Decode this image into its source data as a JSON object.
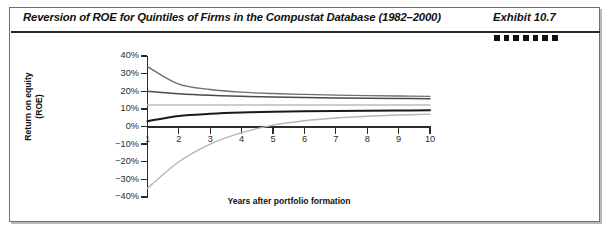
{
  "exhibit": {
    "title": "Reversion of ROE for Quintiles of Firms in the Compustat Database (1982–2000)",
    "label": "Exhibit 10.7",
    "decorative_square_count": 7,
    "decorative_square_color": "#111111",
    "border_color": "#6e6e6e"
  },
  "chart_data": {
    "type": "line",
    "title": "Reversion of ROE for Quintiles of Firms in the Compustat Database (1982–2000)",
    "xlabel": "Years after portfolio formation",
    "ylabel": "Return on equity (ROE)",
    "ylabel_lines": [
      "Return on equity",
      "(ROE)"
    ],
    "x": [
      1,
      2,
      3,
      4,
      5,
      6,
      7,
      8,
      9,
      10
    ],
    "xtick_labels": [
      "1",
      "2",
      "3",
      "4",
      "5",
      "6",
      "7",
      "8",
      "9",
      "10"
    ],
    "xlim": [
      1,
      10
    ],
    "ylim": [
      -40,
      40
    ],
    "ytick_labels": [
      "40%",
      "30%",
      "20%",
      "10%",
      "0%",
      "−10%",
      "−20%",
      "−30%",
      "−40%"
    ],
    "ytick_values": [
      40,
      30,
      20,
      10,
      0,
      -10,
      -20,
      -30,
      -40
    ],
    "grid": false,
    "legend": false,
    "axis_zero_line": true,
    "series": [
      {
        "name": "Quintile 1 (highest ROE)",
        "color": "#6f6f6f",
        "width": 1.4,
        "values": [
          34,
          24,
          21,
          19.5,
          18.7,
          18.2,
          17.8,
          17.5,
          17.3,
          17.1
        ]
      },
      {
        "name": "Quintile 2",
        "color": "#4a4a4a",
        "width": 1.5,
        "values": [
          20,
          18.6,
          17.7,
          17.1,
          16.7,
          16.4,
          16.2,
          16.0,
          15.9,
          15.8
        ]
      },
      {
        "name": "Quintile 3 (median)",
        "color": "#bdbdbd",
        "width": 1.5,
        "values": [
          12.2,
          12.2,
          12.2,
          12.2,
          12.2,
          12.2,
          12.2,
          12.2,
          12.2,
          12.2
        ]
      },
      {
        "name": "Quintile 4",
        "color": "#1a1a1a",
        "width": 2.0,
        "values": [
          3.0,
          6.0,
          7.2,
          7.9,
          8.3,
          8.6,
          8.8,
          9.0,
          9.1,
          9.2
        ]
      },
      {
        "name": "Quintile 5 (lowest ROE)",
        "color": "#b5b5b5",
        "width": 1.4,
        "values": [
          -35,
          -20,
          -10,
          -3.5,
          0.8,
          3.3,
          4.8,
          5.8,
          6.5,
          7.0
        ]
      }
    ]
  }
}
